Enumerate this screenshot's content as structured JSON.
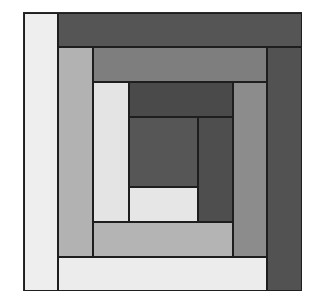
{
  "diagram": {
    "type": "log-cabin-quilt-block",
    "colors": {
      "white": "#ebebeb",
      "light": "#e8e8e8",
      "medium_light": "#b0b0b0",
      "medium": "#8a8a8a",
      "medium_dark": "#7c7c7c",
      "dark": "#5a5a5a",
      "darker": "#4c4c4c",
      "center": "#555555"
    },
    "strips": [
      {
        "name": "center-square",
        "x": 105,
        "y": 104,
        "w": 69,
        "h": 70,
        "color": "#565656"
      },
      {
        "name": "round1-right-dark",
        "x": 174,
        "y": 104,
        "w": 35,
        "h": 105,
        "color": "#4e4e4e"
      },
      {
        "name": "round1-bottom-light",
        "x": 105,
        "y": 174,
        "w": 69,
        "h": 35,
        "color": "#e6e6e6"
      },
      {
        "name": "round1-left-light",
        "x": 69,
        "y": 69,
        "w": 36,
        "h": 140,
        "color": "#e4e4e4"
      },
      {
        "name": "round1-top-dark",
        "x": 105,
        "y": 69,
        "w": 104,
        "h": 35,
        "color": "#4a4a4a"
      },
      {
        "name": "round2-right-medium",
        "x": 209,
        "y": 69,
        "w": 34,
        "h": 175,
        "color": "#8c8c8c"
      },
      {
        "name": "round2-bottom-mlight",
        "x": 69,
        "y": 209,
        "w": 140,
        "h": 35,
        "color": "#b4b4b4"
      },
      {
        "name": "round2-left-mlight",
        "x": 34,
        "y": 34,
        "w": 35,
        "h": 210,
        "color": "#b2b2b2"
      },
      {
        "name": "round2-top-medium",
        "x": 69,
        "y": 34,
        "w": 174,
        "h": 35,
        "color": "#7e7e7e"
      },
      {
        "name": "round3-right-dark",
        "x": 243,
        "y": 34,
        "w": 35,
        "h": 244,
        "color": "#525252"
      },
      {
        "name": "round3-bottom-light",
        "x": 34,
        "y": 244,
        "w": 209,
        "h": 34,
        "color": "#ececec"
      },
      {
        "name": "round3-left-light",
        "x": 0,
        "y": 0,
        "w": 34,
        "h": 278,
        "color": "#eeeeee"
      },
      {
        "name": "round3-top-dark",
        "x": 34,
        "y": 0,
        "w": 244,
        "h": 34,
        "color": "#555555"
      }
    ]
  }
}
